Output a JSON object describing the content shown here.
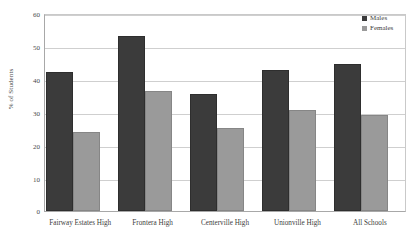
{
  "chart_data": {
    "type": "bar",
    "title": "",
    "xlabel": "",
    "ylabel": "% of Students",
    "ylim": [
      0,
      60
    ],
    "yticks": [
      0,
      10,
      20,
      30,
      40,
      50,
      60
    ],
    "grid": true,
    "legend_position": "top-right",
    "categories": [
      "Fairway Estates High",
      "Frontera High",
      "Centerville High",
      "Unionville High",
      "All Schools"
    ],
    "series": [
      {
        "name": "Males",
        "color": "#3b3b3b",
        "values": [
          42.4,
          53.2,
          35.7,
          42.8,
          44.7
        ]
      },
      {
        "name": "Females",
        "color": "#9a9a9a",
        "values": [
          24.1,
          36.6,
          25.2,
          30.8,
          29.1
        ]
      }
    ]
  },
  "axis": {
    "y_title": "% of Students",
    "tick_0": "0",
    "tick_10": "10",
    "tick_20": "20",
    "tick_30": "30",
    "tick_40": "40",
    "tick_50": "50",
    "tick_60": "60"
  },
  "legend": {
    "males_label": "Males",
    "females_label": "Females"
  }
}
